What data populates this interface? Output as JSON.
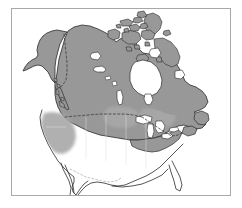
{
  "figure": {
    "kind": "distribution-range-map",
    "region_title": "North America",
    "caption": "",
    "width_px": 242,
    "height_px": 208
  },
  "frame": {
    "name": "map-border",
    "x": 11,
    "y": 8,
    "width": 220,
    "height": 188,
    "stroke_color": "#a8a8a8",
    "stroke_width_px": 1,
    "background_color": "#ffffff"
  },
  "colors": {
    "range_shading": "#989898",
    "range_shading_light": "#b4b4b4",
    "land_outline": "#2b2b2b",
    "unshaded_land": "#ffffff",
    "water": "#ffffff",
    "international_border": "#4a4a4a",
    "internal_border": "#b0b0b0",
    "frame": "#a8a8a8"
  },
  "legend": {
    "visible": false,
    "entries": [
      {
        "label": "Shaded range (present)",
        "swatch": "#989898"
      },
      {
        "label": "Outside range",
        "swatch": "#ffffff"
      }
    ]
  },
  "map_features": {
    "landmasses": [
      {
        "name": "alaska",
        "shaded": true
      },
      {
        "name": "canada-mainland",
        "shaded": true
      },
      {
        "name": "canadian-arctic-archipelago",
        "shaded": true
      },
      {
        "name": "baffin-island",
        "shaded": true
      },
      {
        "name": "newfoundland",
        "shaded": true
      },
      {
        "name": "vancouver-island",
        "shaded": true
      },
      {
        "name": "haida-gwaii",
        "shaded": true
      },
      {
        "name": "united-states-conterminous",
        "shaded": false
      },
      {
        "name": "mexico-northern",
        "shaded": false
      }
    ],
    "water_bodies": [
      {
        "name": "hudson-bay"
      },
      {
        "name": "great-bear-lake"
      },
      {
        "name": "great-slave-lake"
      },
      {
        "name": "lake-winnipeg"
      },
      {
        "name": "lake-superior"
      },
      {
        "name": "lake-michigan"
      },
      {
        "name": "lake-huron"
      },
      {
        "name": "lake-erie"
      },
      {
        "name": "lake-ontario"
      },
      {
        "name": "pacific-ocean"
      },
      {
        "name": "atlantic-ocean"
      },
      {
        "name": "arctic-ocean"
      },
      {
        "name": "gulf-of-mexico"
      }
    ],
    "borders": [
      {
        "name": "canada-usa-49th-parallel",
        "style": "dashed"
      },
      {
        "name": "alaska-yukon-border",
        "style": "dashed"
      },
      {
        "name": "usa-mexico-border",
        "style": "dashed"
      }
    ]
  },
  "labels": {
    "visible": [],
    "note": "No text labels are rendered on this map."
  }
}
